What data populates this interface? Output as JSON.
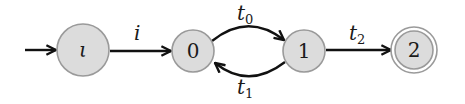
{
  "diagram": {
    "type": "automaton",
    "states": [
      {
        "id": "iota",
        "label": "ι",
        "initial": true,
        "accepting": false
      },
      {
        "id": "s0",
        "label": "0",
        "initial": false,
        "accepting": false
      },
      {
        "id": "s1",
        "label": "1",
        "initial": false,
        "accepting": false
      },
      {
        "id": "s2",
        "label": "2",
        "initial": false,
        "accepting": true
      }
    ],
    "transitions": [
      {
        "from": "iota",
        "to": "s0",
        "label": "i",
        "label_base": "i",
        "label_sub": ""
      },
      {
        "from": "s0",
        "to": "s1",
        "label": "t0",
        "label_base": "t",
        "label_sub": "0"
      },
      {
        "from": "s1",
        "to": "s0",
        "label": "t1",
        "label_base": "t",
        "label_sub": "1"
      },
      {
        "from": "s1",
        "to": "s2",
        "label": "t2",
        "label_base": "t",
        "label_sub": "2"
      }
    ],
    "colors": {
      "node_fill": "#dcdcdc",
      "node_stroke": "#9a9a9a",
      "edge": "#111111"
    }
  }
}
